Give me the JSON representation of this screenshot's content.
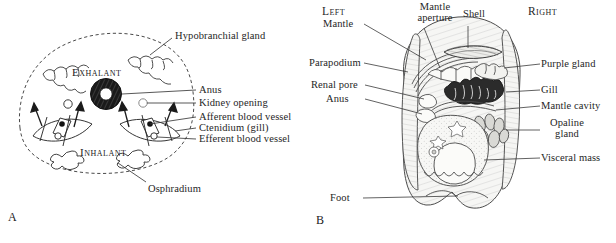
{
  "figure": {
    "panels": [
      {
        "letter": "A",
        "caption_position": "bottom-left",
        "orientation_words": [
          "Exhalant",
          "Inhalant"
        ],
        "flow": {
          "exhalant": "Exhalant",
          "inhalant": "Inhalant"
        },
        "labels": [
          {
            "id": "hypobranchial-gland",
            "text": "Hypobranchial gland",
            "side": "top-right"
          },
          {
            "id": "anus",
            "text": "Anus",
            "side": "right"
          },
          {
            "id": "kidney-opening",
            "text": "Kidney opening",
            "side": "right"
          },
          {
            "id": "afferent-blood-vessel",
            "text": "Afferent blood vessel",
            "side": "right"
          },
          {
            "id": "ctenidium-gill",
            "text": "Ctenidium (gill)",
            "side": "right"
          },
          {
            "id": "efferent-blood-vessel",
            "text": "Efferent blood vessel",
            "side": "right"
          },
          {
            "id": "osphradium",
            "text": "Osphradium",
            "side": "bottom-right"
          }
        ]
      },
      {
        "letter": "B",
        "caption_position": "bottom-left",
        "orientation_words": [
          "Left",
          "Right"
        ],
        "sides": {
          "left": "Left",
          "right": "Right"
        },
        "labels": [
          {
            "id": "mantle",
            "text": "Mantle",
            "side": "top-left"
          },
          {
            "id": "mantle-aperture",
            "text": "Mantle aperture",
            "side": "top-center",
            "lines": [
              "Mantle",
              "aperture"
            ]
          },
          {
            "id": "shell",
            "text": "Shell",
            "side": "top-center"
          },
          {
            "id": "parapodium",
            "text": "Parapodium",
            "side": "left"
          },
          {
            "id": "renal-pore",
            "text": "Renal pore",
            "side": "left"
          },
          {
            "id": "anus",
            "text": "Anus",
            "side": "left"
          },
          {
            "id": "foot",
            "text": "Foot",
            "side": "bottom-left"
          },
          {
            "id": "purple-gland",
            "text": "Purple gland",
            "side": "right"
          },
          {
            "id": "gill",
            "text": "Gill",
            "side": "right"
          },
          {
            "id": "mantle-cavity",
            "text": "Mantle cavity",
            "side": "right"
          },
          {
            "id": "opaline-gland",
            "text": "Opaline gland",
            "side": "right",
            "lines": [
              "Opaline",
              "gland"
            ]
          },
          {
            "id": "visceral-mass",
            "text": "Visceral mass",
            "side": "right"
          }
        ]
      }
    ],
    "colors": {
      "ink": "#1b1b1b",
      "leader": "#3a3a3a",
      "tissue_fill": "#f4f4f2",
      "stipple": "#8d8d8d",
      "dark_organ": "#2a2a2a",
      "background": "#ffffff"
    }
  }
}
